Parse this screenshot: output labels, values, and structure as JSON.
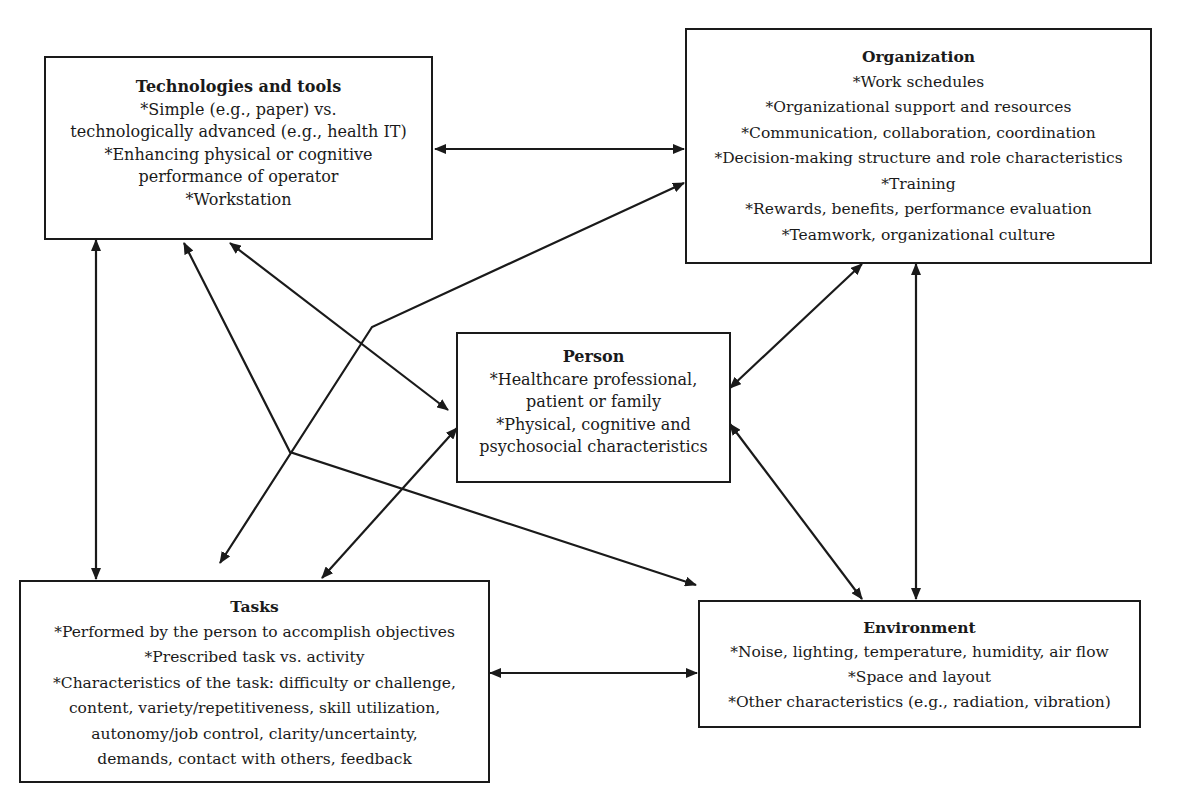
{
  "diagram": {
    "line_color": "#1a1a1a",
    "boxes": {
      "technologies": {
        "title": "Technologies and tools",
        "lines": [
          "*Simple (e.g., paper) vs.",
          "technologically advanced (e.g., health IT)",
          "*Enhancing physical or cognitive",
          "performance of operator",
          "*Workstation"
        ]
      },
      "organization": {
        "title": "Organization",
        "lines": [
          "*Work schedules",
          "*Organizational support and resources",
          "*Communication, collaboration, coordination",
          "*Decision-making structure and role characteristics",
          "*Training",
          "*Rewards, benefits, performance evaluation",
          "*Teamwork, organizational culture"
        ]
      },
      "person": {
        "title": "Person",
        "lines": [
          "*Healthcare professional,",
          "patient or family",
          "*Physical, cognitive and",
          "psychosocial characteristics"
        ]
      },
      "tasks": {
        "title": "Tasks",
        "lines": [
          "*Performed by the person to accomplish objectives",
          "*Prescribed task vs. activity",
          "*Characteristics of the task: difficulty or challenge,",
          "content, variety/repetitiveness, skill utilization,",
          "autonomy/job control, clarity/uncertainty,",
          "demands, contact with others, feedback"
        ]
      },
      "environment": {
        "title": "Environment",
        "lines": [
          "*Noise, lighting, temperature, humidity, air flow",
          "*Space and layout",
          "*Other characteristics (e.g., radiation, vibration)"
        ]
      }
    },
    "connections": [
      {
        "from": "Technologies and tools",
        "to": "Organization",
        "type": "bidirectional"
      },
      {
        "from": "Technologies and tools",
        "to": "Tasks",
        "type": "bidirectional"
      },
      {
        "from": "Technologies and tools",
        "to": "Person",
        "type": "bidirectional"
      },
      {
        "from": "Technologies and tools",
        "to": "Environment",
        "type": "bidirectional"
      },
      {
        "from": "Organization",
        "to": "Tasks",
        "type": "bidirectional"
      },
      {
        "from": "Organization",
        "to": "Person",
        "type": "bidirectional"
      },
      {
        "from": "Organization",
        "to": "Environment",
        "type": "bidirectional"
      },
      {
        "from": "Person",
        "to": "Tasks",
        "type": "bidirectional"
      },
      {
        "from": "Person",
        "to": "Environment",
        "type": "bidirectional"
      },
      {
        "from": "Tasks",
        "to": "Environment",
        "type": "bidirectional"
      }
    ]
  }
}
